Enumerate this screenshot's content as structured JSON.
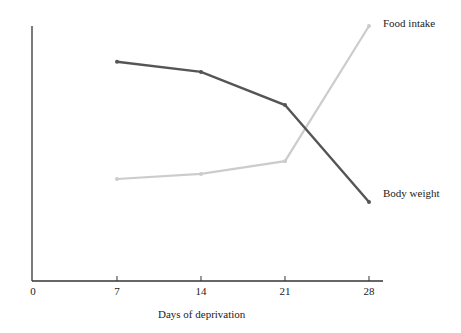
{
  "chart_data": {
    "type": "line",
    "title": "",
    "xlabel": "Days of deprivation",
    "ylabel": "",
    "x": [
      7,
      14,
      21,
      28
    ],
    "x_ticks": [
      "0",
      "7",
      "14",
      "21",
      "28"
    ],
    "xlim": [
      0,
      29
    ],
    "ylim": [
      0,
      100
    ],
    "grid": false,
    "legend": "inline labels at line ends (right)",
    "series": [
      {
        "name": "Body weight",
        "color": "#555555",
        "values": [
          86,
          82,
          69,
          31
        ]
      },
      {
        "name": "Food intake",
        "color": "#cccccc",
        "values": [
          40,
          42,
          47,
          100
        ]
      }
    ]
  },
  "labels": {
    "xlabel": "Days of deprivation",
    "series_food": "Food intake",
    "series_body": "Body weight",
    "ticks": [
      "0",
      "7",
      "14",
      "21",
      "28"
    ]
  }
}
